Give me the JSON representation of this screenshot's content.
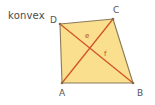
{
  "figure": {
    "caption": "konvex",
    "shape_type": "quadrilateral",
    "colors": {
      "background": "#ffffff",
      "fill": "#f9df8e",
      "outline": "#8a7a5a",
      "diagonal": "#d4552b",
      "vertex_text": "#55534f",
      "caption_text": "#4a4a48",
      "diagonal_text": "#b8501f"
    },
    "vertices": [
      {
        "name": "A",
        "label": "A",
        "x": 62,
        "y": 83
      },
      {
        "name": "B",
        "label": "B",
        "x": 133,
        "y": 83
      },
      {
        "name": "C",
        "label": "C",
        "x": 113,
        "y": 19
      },
      {
        "name": "D",
        "label": "D",
        "x": 60,
        "y": 24
      }
    ],
    "edges": [
      {
        "name": "edge-AB",
        "from": "A",
        "to": "B"
      },
      {
        "name": "edge-BC",
        "from": "B",
        "to": "C"
      },
      {
        "name": "edge-CD",
        "from": "C",
        "to": "D"
      },
      {
        "name": "edge-DA",
        "from": "D",
        "to": "A"
      }
    ],
    "diagonals": [
      {
        "name": "diagonal-AC",
        "label": "e",
        "from": "A",
        "to": "C",
        "label_x": 86,
        "label_y": 36
      },
      {
        "name": "diagonal-DB",
        "label": "f",
        "from": "D",
        "to": "B",
        "label_x": 105,
        "label_y": 54
      }
    ]
  }
}
